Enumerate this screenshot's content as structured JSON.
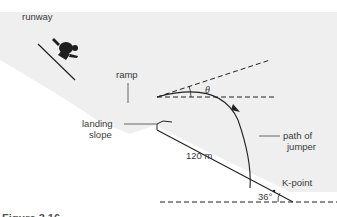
{
  "labels": {
    "runway": "runway",
    "ramp": "ramp",
    "landing_slope_line1": "landing",
    "landing_slope_line2": "slope",
    "path_line1": "path of",
    "path_line2": "jumper",
    "distance": "120 m",
    "k_point": "K-point",
    "landing_angle": "36°",
    "takeoff_angle": "θ"
  },
  "caption": "Figure 3.16",
  "colors": {
    "background": "#ffffff",
    "hill_fill": "#efefef",
    "line": "#222222",
    "text": "#3a3a3a"
  }
}
